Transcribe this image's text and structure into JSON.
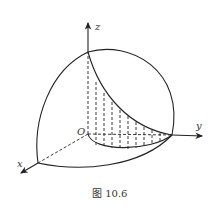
{
  "figure": {
    "caption": "图 10.6",
    "axes": {
      "x_label": "x",
      "y_label": "y",
      "z_label": "z",
      "origin_label": "O"
    },
    "hatch_line_count": 9
  }
}
